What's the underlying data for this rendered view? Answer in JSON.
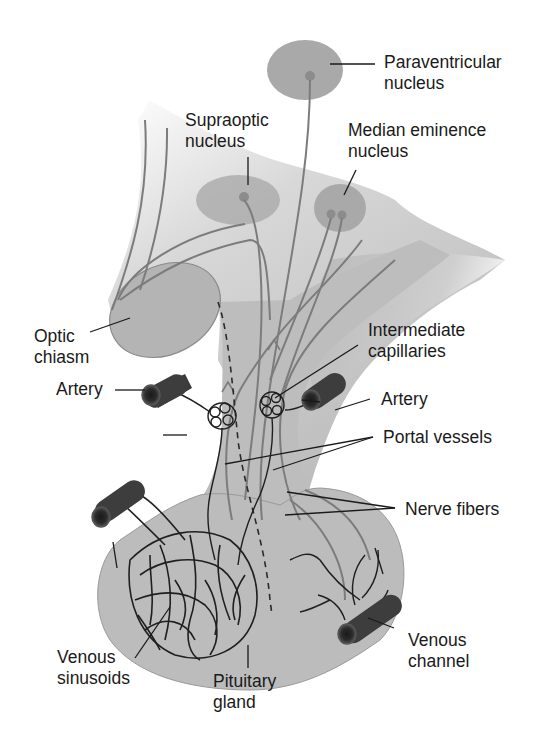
{
  "colors": {
    "background": "#ffffff",
    "tissue_light": "#c4c4c4",
    "tissue_mid": "#b3b3b3",
    "tissue_dark": "#a2a2a2",
    "nucleus_fill": "#a9a9a9",
    "nerve_fiber": "#7c7c7c",
    "vessel_dark": "#2a2a2a",
    "artery_fill": "#3d3d3d",
    "label_text": "#1a1a1a",
    "leader_line": "#1a1a1a"
  },
  "labels": {
    "paraventricular": "Paraventricular\nnucleus",
    "supraoptic": "Supraoptic\nnucleus",
    "median_eminence": "Median eminence\nnucleus",
    "optic_chiasm": "Optic\nchiasm",
    "intermediate_capillaries": "Intermediate\ncapillaries",
    "artery_left": "Artery",
    "artery_right": "Artery",
    "portal_vessels": "Portal vessels",
    "nerve_fibers": "Nerve fibers",
    "venous_sinusoids": "Venous\nsinusoids",
    "pituitary_gland": "Pituitary\ngland",
    "venous_channel": "Venous\nchannel"
  }
}
